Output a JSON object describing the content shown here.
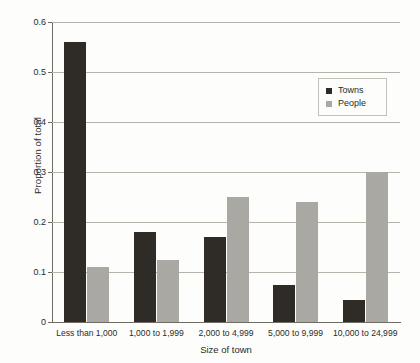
{
  "chart_data": {
    "type": "bar",
    "title": "",
    "xlabel": "Size of town",
    "ylabel": "Proportion of total",
    "categories": [
      "Less than 1,000",
      "1,000 to 1,999",
      "2,000 to 4,999",
      "5,000 to 9,999",
      "10,000 to 24,999"
    ],
    "series": [
      {
        "name": "Towns",
        "color": "#2f2b27",
        "values": [
          0.56,
          0.18,
          0.17,
          0.075,
          0.045
        ]
      },
      {
        "name": "People",
        "color": "#a9a8a3",
        "values": [
          0.11,
          0.125,
          0.25,
          0.24,
          0.3
        ]
      }
    ],
    "ylim": [
      0,
      0.6
    ],
    "ytick_values": [
      0,
      0.1,
      0.2,
      0.3,
      0.4,
      0.5,
      0.6
    ],
    "ytick_labels": [
      "0",
      "0.1",
      "0.2",
      "0.3",
      "0.4",
      "0.5",
      "0.6"
    ],
    "grid": true,
    "grid_axis": "y",
    "legend_position": "upper right",
    "background_color": "#fdfdfb",
    "axis_color": "#6d6b63",
    "gridline_color": "#b5b3aa"
  },
  "legend": {
    "entries": [
      {
        "label": "Towns"
      },
      {
        "label": "People"
      }
    ]
  }
}
